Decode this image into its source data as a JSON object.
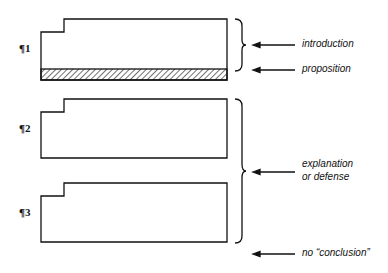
{
  "paragraphs": [
    {
      "label": "¶1",
      "hatched_proposition": true
    },
    {
      "label": "¶2",
      "hatched_proposition": false
    },
    {
      "label": "¶3",
      "hatched_proposition": false
    }
  ],
  "annotations": {
    "introduction": "introduction",
    "proposition": "proposition",
    "explanation_line1": "explanation",
    "explanation_line2": "or defense",
    "no_conclusion": "no “conclusion”"
  },
  "colors": {
    "stroke": "#111111",
    "background": "#ffffff"
  }
}
